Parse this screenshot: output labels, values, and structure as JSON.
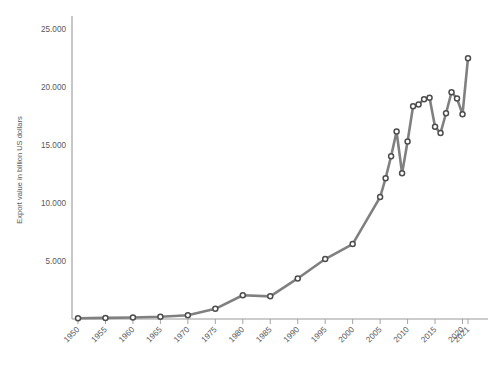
{
  "chart_data": {
    "type": "line",
    "title": "",
    "xlabel": "",
    "ylabel": "Export value in billion US dollars",
    "xlim": [
      1950,
      2021
    ],
    "ylim": [
      0,
      26000
    ],
    "grid": false,
    "legend": null,
    "y_ticks": [
      "5.000",
      "10.000",
      "15.000",
      "20.000",
      "25.000"
    ],
    "y_tick_values": [
      5000,
      10000,
      15000,
      20000,
      25000
    ],
    "x_ticks": [
      "1950",
      "1955",
      "1960",
      "1965",
      "1970",
      "1975",
      "1980",
      "1985",
      "1990",
      "1995",
      "2000",
      "2005",
      "2010",
      "2015",
      "2020",
      "2021"
    ],
    "x_tick_values": [
      1950,
      1955,
      1960,
      1965,
      1970,
      1975,
      1980,
      1985,
      1990,
      1995,
      2000,
      2005,
      2010,
      2015,
      2020,
      2021
    ],
    "series": [
      {
        "name": "Export value",
        "line_color": "#808080",
        "marker_color": "#4d4d4d",
        "x": [
          1950,
          1955,
          1960,
          1965,
          1970,
          1975,
          1980,
          1985,
          1990,
          1995,
          2000,
          2005,
          2006,
          2007,
          2008,
          2009,
          2010,
          2011,
          2012,
          2013,
          2014,
          2015,
          2016,
          2017,
          2018,
          2019,
          2020,
          2021
        ],
        "values": [
          62,
          95,
          130,
          190,
          317,
          877,
          2049,
          1954,
          3495,
          5168,
          6456,
          10509,
          12133,
          14027,
          16159,
          12555,
          15302,
          18338,
          18497,
          18953,
          19080,
          16564,
          16035,
          17738,
          19548,
          19015,
          17645,
          22484
        ]
      }
    ]
  },
  "axis": {
    "y_axis_name": "y-axis-line",
    "x_axis_name": "x-axis-line"
  }
}
